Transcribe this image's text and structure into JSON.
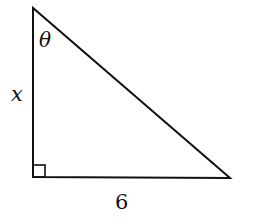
{
  "diagram": {
    "type": "right-triangle",
    "vertices": {
      "top": [
        33,
        8
      ],
      "right_angle": [
        33,
        177
      ],
      "bottom_right": [
        230,
        178
      ]
    },
    "labels": {
      "angle": "θ",
      "vertical_side": "x",
      "horizontal_side": "6"
    },
    "right_angle_marker": true,
    "colors": {
      "stroke": "#111111",
      "background": "#ffffff"
    }
  }
}
